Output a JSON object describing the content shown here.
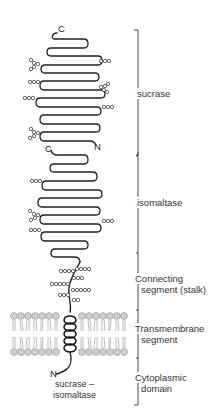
{
  "diagram": {
    "colors": {
      "chain": "#222222",
      "bracket": "#333333",
      "sugar_circle_stroke": "#444444",
      "membrane_head_fill": "#c8c8c8",
      "membrane_tail": "#9a9a9a",
      "text": "#333333"
    },
    "termini": {
      "sucrase_c": "C",
      "sucrase_n": "N",
      "isomaltase_c": "C",
      "protein_n": "N"
    },
    "protein_label": {
      "line1": "sucrase –",
      "line2": "isomaltase"
    },
    "domains": [
      {
        "name": "sucrase",
        "lines": [
          "sucrase"
        ],
        "y_start": 30,
        "y_end": 155
      },
      {
        "name": "isomaltase",
        "lines": [
          "isomaltase"
        ],
        "y_start": 155,
        "y_end": 254
      },
      {
        "name": "connecting-segment",
        "lines": [
          "Connecting",
          "segment (stalk)"
        ],
        "y_start": 254,
        "y_end": 310
      },
      {
        "name": "transmembrane-segment",
        "lines": [
          "Transmembrane",
          "segment"
        ],
        "y_start": 310,
        "y_end": 358
      },
      {
        "name": "cytoplasmic-domain",
        "lines": [
          "Cytoplasmic",
          "domain"
        ],
        "y_start": 358,
        "y_end": 405
      }
    ]
  }
}
